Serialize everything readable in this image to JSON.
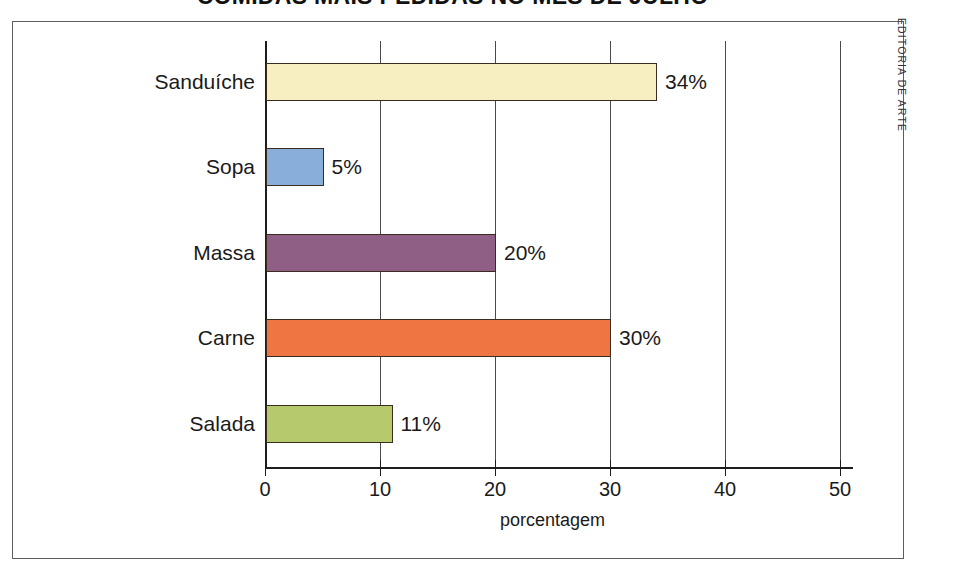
{
  "title": "COMIDAS MAIS PEDIDAS NO MÊS DE JULHO",
  "credit": "EDITORIA DE ARTE",
  "xaxis_title": "porcentagem",
  "chart_data": {
    "type": "bar",
    "orientation": "horizontal",
    "title": "COMIDAS MAIS PEDIDAS NO MÊS DE JULHO",
    "xlabel": "porcentagem",
    "ylabel": "",
    "xlim": [
      0,
      52
    ],
    "xticks": [
      0,
      10,
      20,
      30,
      40,
      50
    ],
    "xtick_labels": [
      "0",
      "10",
      "20",
      "30",
      "40",
      "50"
    ],
    "grid": true,
    "grid_axis": "x",
    "legend": false,
    "value_suffix": "%",
    "categories": [
      "Sanduíche",
      "Sopa",
      "Massa",
      "Carne",
      "Salada"
    ],
    "values": [
      34,
      5,
      20,
      30,
      11
    ],
    "value_labels": [
      "34%",
      "5%",
      "20%",
      "30%",
      "11%"
    ],
    "colors": [
      "#f7eec2",
      "#89aeda",
      "#8f5f86",
      "#ef7642",
      "#b6c96c"
    ],
    "bar_edge_color": "#3a2d20",
    "bars": [
      {
        "category": "Sanduíche",
        "value": 34,
        "label": "34%",
        "color": "#f7eec2"
      },
      {
        "category": "Sopa",
        "value": 5,
        "label": "5%",
        "color": "#89aeda"
      },
      {
        "category": "Massa",
        "value": 20,
        "label": "20%",
        "color": "#8f5f86"
      },
      {
        "category": "Carne",
        "value": 30,
        "label": "30%",
        "color": "#ef7642"
      },
      {
        "category": "Salada",
        "value": 11,
        "label": "11%",
        "color": "#b6c96c"
      }
    ]
  }
}
